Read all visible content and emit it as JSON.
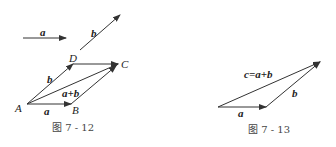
{
  "figure_left": {
    "caption": "图 7 - 12",
    "free_vectors": {
      "a": "a",
      "b": "b"
    },
    "points": {
      "A": "A",
      "B": "B",
      "C": "C",
      "D": "D"
    },
    "edge_labels": {
      "AB": "a",
      "AD": "b",
      "AC": "a+b"
    }
  },
  "figure_right": {
    "caption": "图 7 - 13",
    "edge_labels": {
      "a": "a",
      "b": "b",
      "c": "c=a+b"
    }
  },
  "colors": {
    "line": "#333333",
    "text": "#222222",
    "caption": "#444444"
  }
}
